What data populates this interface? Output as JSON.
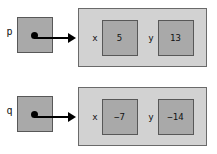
{
  "diagram": {
    "type": "pointer-struct-diagram",
    "background_color": "#ffffff",
    "cell_color": "#a9a9a9",
    "struct_color": "#d2d2d2",
    "border_color": "#585858",
    "arrow_color": "#000000",
    "rows": [
      {
        "pointer_label": "p",
        "arrow": "→",
        "fields": [
          {
            "name": "x",
            "value": "5"
          },
          {
            "name": "y",
            "value": "13"
          }
        ]
      },
      {
        "pointer_label": "q",
        "arrow": "→",
        "fields": [
          {
            "name": "x",
            "value": "−7"
          },
          {
            "name": "y",
            "value": "−14"
          }
        ]
      }
    ]
  }
}
